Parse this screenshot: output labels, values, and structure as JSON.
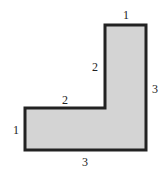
{
  "diagram": {
    "shape": "L-shaped polygon",
    "fill_color": "#d4d4d4",
    "stroke_color": "#222222",
    "labels": {
      "top": "1",
      "inner_vertical": "2",
      "right": "3",
      "inner_horizontal": "2",
      "left": "1",
      "bottom": "3"
    }
  }
}
